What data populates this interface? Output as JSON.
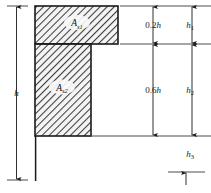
{
  "figure": {
    "type": "engineering-cross-section-diagram",
    "background_color": "#ffffff",
    "line_color": "#1a1a1a",
    "hatch_color": "#4a4a4a",
    "hatch_fill": "#f2f2f2"
  },
  "areas": [
    {
      "id": "top-flange",
      "symbol": "A",
      "subscript": "s1",
      "hatched": true
    },
    {
      "id": "web",
      "symbol": "A",
      "subscript": "s2",
      "hatched": true
    }
  ],
  "dimensions": {
    "overall": {
      "symbol": "h",
      "subscript": "",
      "position": "left",
      "spans": "full-height"
    },
    "inner_column": [
      {
        "id": "dim-0.2h",
        "numeric": "0.2",
        "symbol": "h",
        "subscript": ""
      },
      {
        "id": "dim-0.6h",
        "numeric": "0.6",
        "symbol": "h",
        "subscript": ""
      }
    ],
    "outer_column": [
      {
        "id": "dim-h1",
        "symbol": "h",
        "subscript": "1"
      },
      {
        "id": "dim-h2",
        "symbol": "h",
        "subscript": "2"
      },
      {
        "id": "dim-h3",
        "symbol": "h",
        "subscript": "3"
      }
    ]
  }
}
